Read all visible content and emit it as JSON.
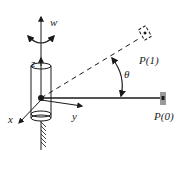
{
  "diagram": {
    "labels": {
      "w": "w",
      "z": "z",
      "x": "x",
      "y": "y",
      "theta": "θ",
      "p1": "P(1)",
      "p0": "P(0)"
    },
    "colors": {
      "line": "#1a1a1a",
      "target_fill": "#9a9a9a",
      "background": "#ffffff"
    }
  }
}
